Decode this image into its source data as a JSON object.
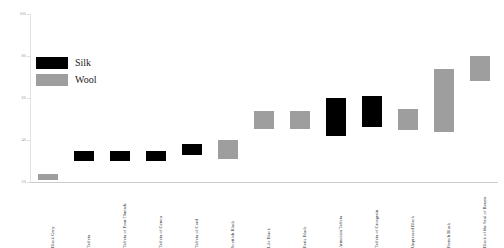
{
  "chart_data": {
    "type": "bar",
    "subtype": "floating-range",
    "title": "",
    "xlabel": "",
    "ylabel": "",
    "ylim": [
      20,
      100
    ],
    "yticks": [
      20,
      40,
      60,
      80,
      100
    ],
    "ytick_labels": [
      "20",
      "40",
      "60",
      "80",
      "100"
    ],
    "grid": false,
    "legend_position": "upper-left",
    "categories": [
      "Black Grey",
      "Taffeta",
      "Taffeta of Four Threads",
      "Taffeta of Genoa",
      "Taffeta of Cord",
      "Scottish Black",
      "Lile Black",
      "Paris Black",
      "Armoisin Taffeta",
      "Taffeta of Grosgrain",
      "Unpressed Black",
      "French Black",
      "Black of the Seal of Rouen"
    ],
    "legend": [
      {
        "name": "Silk",
        "color": "#000000"
      },
      {
        "name": "Wool",
        "color": "#9e9e9e"
      }
    ],
    "bars": [
      {
        "category": "Black Grey",
        "material": "Wool",
        "low": 21,
        "high": 24,
        "color": "#9e9e9e"
      },
      {
        "category": "Taffeta",
        "material": "Silk",
        "low": 30,
        "high": 35,
        "color": "#000000"
      },
      {
        "category": "Taffeta of Four Threads",
        "material": "Silk",
        "low": 30,
        "high": 35,
        "color": "#000000"
      },
      {
        "category": "Taffeta of Genoa",
        "material": "Silk",
        "low": 30,
        "high": 35,
        "color": "#000000"
      },
      {
        "category": "Taffeta of Cord",
        "material": "Silk",
        "low": 33,
        "high": 38,
        "color": "#000000"
      },
      {
        "category": "Scottish Black",
        "material": "Wool",
        "low": 31,
        "high": 40,
        "color": "#9e9e9e"
      },
      {
        "category": "Lile Black",
        "material": "Wool",
        "low": 45,
        "high": 54,
        "color": "#9e9e9e"
      },
      {
        "category": "Paris Black",
        "material": "Wool",
        "low": 45,
        "high": 54,
        "color": "#9e9e9e"
      },
      {
        "category": "Armoisin Taffeta",
        "material": "Silk",
        "low": 42,
        "high": 60,
        "color": "#000000"
      },
      {
        "category": "Taffeta of Grosgrain",
        "material": "Silk",
        "low": 46,
        "high": 61,
        "color": "#000000"
      },
      {
        "category": "Unpressed Black",
        "material": "Wool",
        "low": 45,
        "high": 55,
        "color": "#9e9e9e"
      },
      {
        "category": "French Black",
        "material": "Wool",
        "low": 44,
        "high": 74,
        "color": "#9e9e9e"
      },
      {
        "category": "Black of the Seal of Rouen",
        "material": "Wool",
        "low": 68,
        "high": 80,
        "color": "#9e9e9e"
      }
    ]
  }
}
